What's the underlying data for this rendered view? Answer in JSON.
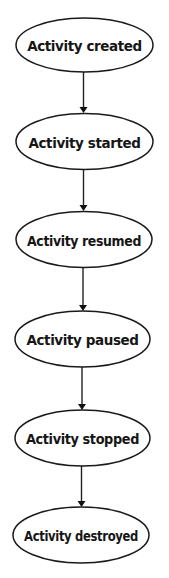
{
  "diagram": {
    "type": "flowchart",
    "orientation": "vertical",
    "colors": {
      "background": "#ffffff",
      "stroke": "#1a1a1a",
      "text": "#161616"
    },
    "nodes": [
      {
        "id": "created",
        "label": "Activity created",
        "shape": "ellipse",
        "cx": 84.5,
        "cy": 45,
        "rx": 68.5,
        "ry": 27
      },
      {
        "id": "started",
        "label": "Activity started",
        "shape": "ellipse",
        "cx": 84.5,
        "cy": 141.5,
        "rx": 68.5,
        "ry": 28
      },
      {
        "id": "resumed",
        "label": "Activity resumed",
        "shape": "ellipse",
        "cx": 84,
        "cy": 239.5,
        "rx": 68,
        "ry": 28
      },
      {
        "id": "paused",
        "label": "Activity paused",
        "shape": "ellipse",
        "cx": 82.5,
        "cy": 339,
        "rx": 67.5,
        "ry": 28
      },
      {
        "id": "stopped",
        "label": "Activity stopped",
        "shape": "ellipse",
        "cx": 82.5,
        "cy": 438,
        "rx": 67.5,
        "ry": 28
      },
      {
        "id": "destroyed",
        "label": "Activity destroyed",
        "shape": "ellipse",
        "cx": 81,
        "cy": 535,
        "rx": 68,
        "ry": 28
      }
    ],
    "edges": [
      {
        "from": "created",
        "to": "started",
        "x": 83.5,
        "y1": 72,
        "y2": 113
      },
      {
        "from": "started",
        "to": "resumed",
        "x": 83.5,
        "y1": 170,
        "y2": 211
      },
      {
        "from": "resumed",
        "to": "paused",
        "x": 83,
        "y1": 268,
        "y2": 311
      },
      {
        "from": "paused",
        "to": "stopped",
        "x": 82,
        "y1": 367,
        "y2": 410
      },
      {
        "from": "stopped",
        "to": "destroyed",
        "x": 81.5,
        "y1": 466,
        "y2": 507
      }
    ]
  }
}
